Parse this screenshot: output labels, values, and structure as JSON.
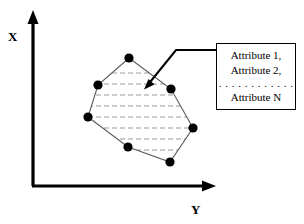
{
  "figure": {
    "type": "scatter-convex-hull-diagram",
    "background_color": "#ffffff",
    "axes": {
      "x_axis": {
        "label": "X",
        "orientation": "vertical",
        "color": "#000000",
        "arrow": "up-arrow-icon"
      },
      "y_axis": {
        "label": "Y",
        "orientation": "horizontal",
        "color": "#000000",
        "arrow": "right-arrow-icon"
      },
      "origin_label": ""
    },
    "cluster": {
      "name": "hatched-polygon-cluster",
      "vertex_color": "#000000",
      "edge_color": "#555555",
      "hatch_color": "#888888",
      "hatch_style": "dashed-horizontal",
      "hatch_line_count": 9,
      "vertices": [
        {
          "id": "p1",
          "x": 129,
          "y": 58
        },
        {
          "id": "p2",
          "x": 171,
          "y": 89
        },
        {
          "id": "p3",
          "x": 193,
          "y": 128
        },
        {
          "id": "p4",
          "x": 170,
          "y": 162
        },
        {
          "id": "p5",
          "x": 128,
          "y": 147
        },
        {
          "id": "p6",
          "x": 88,
          "y": 117
        },
        {
          "id": "p7",
          "x": 98,
          "y": 85
        }
      ]
    },
    "callout": {
      "name": "attribute-callout",
      "arrow_color": "#000000",
      "arrow_tip": {
        "x": 145,
        "y": 88
      },
      "elbow": {
        "x": 176,
        "y": 50
      },
      "anchor": {
        "x": 216,
        "y": 50
      }
    },
    "attribute_box": {
      "border_color": "#000000",
      "fill_color": "#ffffff",
      "lines": [
        "Attribute 1,",
        "Attribute 2,",
        "Attribute N"
      ],
      "ellipsis": ". . . . . . . . . . . ."
    }
  }
}
